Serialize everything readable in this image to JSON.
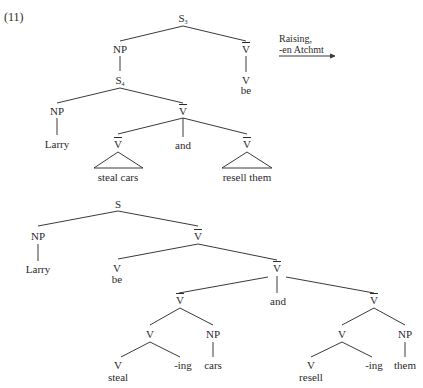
{
  "example_number": "(11)",
  "transformation": {
    "line1": "Raising,",
    "line2": "-en Atchmt",
    "arrow": "right-arrow"
  },
  "top_tree": {
    "root": "S",
    "root_sub": "3",
    "np": "NP",
    "vbar": "V",
    "v": "V",
    "be": "be",
    "embedded_s": "S",
    "embedded_s_sub": "4",
    "embedded_np": "NP",
    "larry": "Larry",
    "coord_vbar": "V",
    "left_vbar": "V",
    "and": "and",
    "right_vbar": "V",
    "left_yield": "steal cars",
    "right_yield": "resell them"
  },
  "bottom_tree": {
    "root": "S",
    "np": "NP",
    "larry": "Larry",
    "vbar": "V",
    "v_be": "V",
    "be": "be",
    "coord_vbar": "V",
    "left_vbar": "V",
    "and": "and",
    "right_vbar": "V",
    "left_v": "V",
    "left_np": "NP",
    "left_v_stem": "V",
    "steal": "steal",
    "left_ing": "-ing",
    "cars": "cars",
    "right_v": "V",
    "right_np": "NP",
    "right_v_stem": "V",
    "resell": "resell",
    "right_ing": "-ing",
    "them": "them"
  }
}
